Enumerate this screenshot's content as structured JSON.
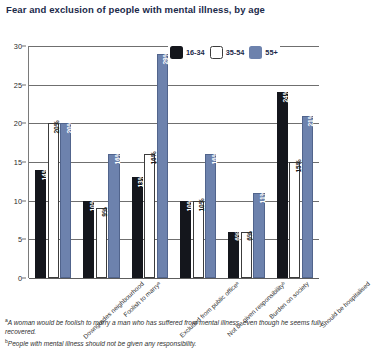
{
  "chart_data": {
    "type": "bar",
    "title": "Fear and exclusion of people with mental illness, by age",
    "xlabel": "",
    "ylabel": "",
    "ylim": [
      0,
      30
    ],
    "yticks": [
      0,
      5,
      10,
      15,
      20,
      25,
      30
    ],
    "grid": true,
    "legend_position": "top-right",
    "categories": [
      "Downgrades neighbourhood",
      "Foolish to marryᵃ",
      "Excluded from public officeᵃ",
      "Not be given responsibilityᵇ",
      "Burden on society",
      "Should be hospitalised"
    ],
    "series": [
      {
        "name": "16-34",
        "color": "#14161c",
        "values": [
          14,
          10,
          13,
          10,
          6,
          24
        ]
      },
      {
        "name": "35-54",
        "color": "#ffffff",
        "values": [
          20,
          9,
          16,
          10,
          6,
          15
        ]
      },
      {
        "name": "55+",
        "color": "#6d82ad",
        "values": [
          20,
          16,
          29,
          16,
          11,
          21
        ]
      }
    ],
    "value_labels": [
      [
        "14%",
        "20%",
        "20%"
      ],
      [
        "10%",
        "9%",
        "16%"
      ],
      [
        "13%",
        "16%",
        "29%"
      ],
      [
        "10%",
        "10%",
        "16%"
      ],
      [
        "6%",
        "6%",
        "11%"
      ],
      [
        "24%",
        "15%",
        "21%"
      ]
    ]
  },
  "legend": {
    "items": [
      {
        "label": "16-34"
      },
      {
        "label": "35-54"
      },
      {
        "label": "55+"
      }
    ]
  },
  "footnotes": [
    {
      "marker": "a",
      "text": "A woman would be foolish to marry a man who has suffered from mental illness, even though he seems fully recovered."
    },
    {
      "marker": "b",
      "text": "People with mental illness should not be given any responsibility."
    }
  ]
}
